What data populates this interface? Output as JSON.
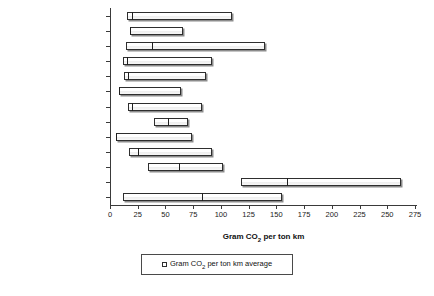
{
  "chart_data": {
    "type": "bar",
    "title": "",
    "xlabel": "Gram CO2 per ton km",
    "xlabel_prefix": "Gram CO",
    "xlabel_subscript": "2",
    "xlabel_suffix": " per ton km",
    "ylabel": "",
    "xlim": [
      0,
      275
    ],
    "xticks": [
      0,
      25,
      50,
      75,
      100,
      125,
      150,
      175,
      200,
      225,
      250,
      275
    ],
    "xtick_labels": [
      "0",
      "25",
      "50",
      "75",
      "100",
      "125",
      "150",
      "175",
      "200",
      "225",
      "250",
      "275"
    ],
    "grid": false,
    "orientation": "horizontal",
    "categories": [
      "LPG",
      "LNG",
      "RoRo",
      "Chemical tankers",
      "Product tankers",
      "Crude oil",
      "Container",
      "Reefer",
      "Dry Bulk",
      "General Cargo",
      "Inland waterways",
      "Road transport",
      "Rail"
    ],
    "series": [
      {
        "name": "range",
        "low": [
          15,
          18,
          14,
          12,
          13,
          8,
          16,
          40,
          5,
          17,
          34,
          118,
          12
        ],
        "high": [
          110,
          66,
          140,
          92,
          87,
          64,
          83,
          70,
          74,
          92,
          102,
          262,
          155
        ]
      },
      {
        "name": "Gram CO2 per ton km average",
        "values": [
          20,
          18,
          38,
          15,
          16,
          8,
          20,
          52,
          5,
          25,
          62,
          160,
          83
        ]
      }
    ]
  },
  "legend": {
    "position": "bottom",
    "swatch": "open-square",
    "prefix": "Gram CO",
    "subscript": "2",
    "suffix": " per ton km average"
  }
}
